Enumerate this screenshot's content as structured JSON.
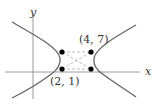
{
  "diagram": {
    "type": "hyperbola-with-rectangle",
    "axes": {
      "x_label": "x",
      "y_label": "y"
    },
    "points": [
      {
        "id": "top-left",
        "label": ""
      },
      {
        "id": "top-right",
        "label": "(4, 7)"
      },
      {
        "id": "bottom-left",
        "label": "(2, 1)"
      },
      {
        "id": "bottom-right",
        "label": ""
      }
    ],
    "labels": {
      "top_right_point": "(4, 7)",
      "bottom_left_point": "(2, 1)"
    },
    "colors": {
      "axis": "#999999",
      "curve": "#666666",
      "dashed": "#aaaaaa",
      "point": "#000000",
      "text": "#333333"
    }
  }
}
